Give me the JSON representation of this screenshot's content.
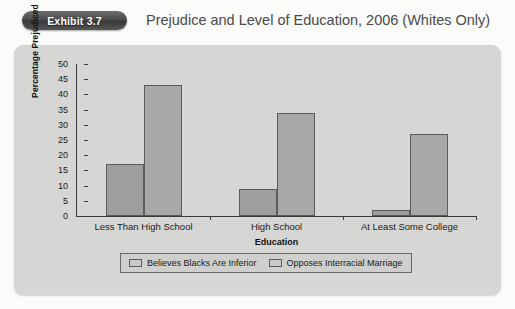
{
  "header": {
    "badge_label": "Exhibit 3.7",
    "title": "Prejudice and Level of Education, 2006 (Whites Only)"
  },
  "chart_data": {
    "type": "bar",
    "title": "Prejudice and Level of Education, 2006 (Whites Only)",
    "xlabel": "Education",
    "ylabel": "Percentage Prejudiced",
    "ylim": [
      0,
      50
    ],
    "yticks": [
      0,
      5,
      10,
      15,
      20,
      25,
      30,
      35,
      40,
      45,
      50
    ],
    "grid": false,
    "legend_position": "bottom",
    "categories": [
      "Less Than High School",
      "High School",
      "At Least Some College"
    ],
    "series": [
      {
        "name": "Believes Blacks Are Inferior",
        "values": [
          17,
          9,
          2
        ]
      },
      {
        "name": "Opposes Interracial Marriage",
        "values": [
          43,
          34,
          27
        ]
      }
    ]
  },
  "colors": {
    "panel_bg": "#d6d6d4",
    "bar_series_0": "#9e9e9c",
    "bar_series_1": "#a8a8a6",
    "bar_border": "#5b5b5b",
    "axis": "#3a3a3a",
    "badge": "#4a4a4a",
    "title_text": "#4a4a4a"
  }
}
